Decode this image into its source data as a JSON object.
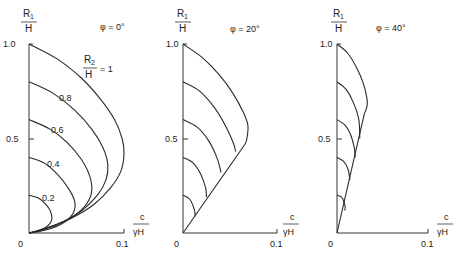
{
  "chart_data": [
    {
      "type": "line",
      "title": "φ = 0°",
      "xlabel": "c/γH",
      "ylabel": "R1/H",
      "xlim": [
        0,
        0.1
      ],
      "ylim": [
        0,
        1.0
      ],
      "xticks": [
        "0",
        "0.1"
      ],
      "yticks": [
        "0.5",
        "1.0"
      ],
      "grid": false,
      "legend_label": "R2/H = 1",
      "series": [
        {
          "name": "R2/H = 1",
          "label": "R2/H = 1",
          "points": [
            [
              0,
              1.0
            ],
            [
              0.03,
              0.92
            ],
            [
              0.055,
              0.82
            ],
            [
              0.075,
              0.71
            ],
            [
              0.09,
              0.6
            ],
            [
              0.098,
              0.5
            ],
            [
              0.1,
              0.42
            ],
            [
              0.097,
              0.33
            ],
            [
              0.086,
              0.24
            ],
            [
              0.068,
              0.15
            ],
            [
              0.045,
              0.08
            ],
            [
              0.02,
              0.03
            ],
            [
              0,
              0
            ]
          ]
        },
        {
          "name": "R2/H = 0.8",
          "label": "0.8",
          "points": [
            [
              0,
              0.8
            ],
            [
              0.025,
              0.74
            ],
            [
              0.048,
              0.65
            ],
            [
              0.066,
              0.55
            ],
            [
              0.078,
              0.45
            ],
            [
              0.083,
              0.36
            ],
            [
              0.081,
              0.28
            ],
            [
              0.072,
              0.2
            ],
            [
              0.056,
              0.12
            ],
            [
              0.036,
              0.06
            ],
            [
              0.016,
              0.02
            ],
            [
              0,
              0
            ]
          ]
        },
        {
          "name": "R2/H = 0.6",
          "label": "0.6",
          "points": [
            [
              0,
              0.6
            ],
            [
              0.022,
              0.55
            ],
            [
              0.04,
              0.48
            ],
            [
              0.055,
              0.39
            ],
            [
              0.064,
              0.3
            ],
            [
              0.066,
              0.22
            ],
            [
              0.06,
              0.15
            ],
            [
              0.047,
              0.09
            ],
            [
              0.03,
              0.045
            ],
            [
              0.013,
              0.015
            ],
            [
              0,
              0
            ]
          ]
        },
        {
          "name": "R2/H = 0.4",
          "label": "0.4",
          "points": [
            [
              0,
              0.4
            ],
            [
              0.016,
              0.37
            ],
            [
              0.03,
              0.31
            ],
            [
              0.041,
              0.24
            ],
            [
              0.048,
              0.17
            ],
            [
              0.047,
              0.11
            ],
            [
              0.038,
              0.06
            ],
            [
              0.024,
              0.025
            ],
            [
              0.01,
              0.007
            ],
            [
              0,
              0
            ]
          ]
        },
        {
          "name": "R2/H = 0.2",
          "label": "0.2",
          "points": [
            [
              0,
              0.2
            ],
            [
              0.01,
              0.185
            ],
            [
              0.018,
              0.15
            ],
            [
              0.023,
              0.11
            ],
            [
              0.024,
              0.07
            ],
            [
              0.019,
              0.035
            ],
            [
              0.01,
              0.012
            ],
            [
              0,
              0
            ]
          ]
        }
      ]
    },
    {
      "type": "line",
      "title": "φ = 20°",
      "xlabel": "c/γH",
      "ylabel": "R1/H",
      "xlim": [
        0,
        0.1
      ],
      "ylim": [
        0,
        1.0
      ],
      "xticks": [
        "0",
        "0.1"
      ],
      "yticks": [
        "0.5",
        "1.0"
      ],
      "grid": false,
      "series": [
        {
          "name": "R2/H = 1",
          "points": [
            [
              0,
              1.0
            ],
            [
              0.02,
              0.93
            ],
            [
              0.038,
              0.84
            ],
            [
              0.053,
              0.74
            ],
            [
              0.064,
              0.64
            ],
            [
              0.069,
              0.57
            ],
            [
              0.068,
              0.5
            ],
            [
              0.066,
              0.47
            ]
          ]
        },
        {
          "name": "R2/H = 0.8",
          "points": [
            [
              0,
              0.8
            ],
            [
              0.018,
              0.75
            ],
            [
              0.034,
              0.66
            ],
            [
              0.046,
              0.56
            ],
            [
              0.054,
              0.47
            ],
            [
              0.056,
              0.43
            ]
          ]
        },
        {
          "name": "R2/H = 0.6",
          "points": [
            [
              0,
              0.6
            ],
            [
              0.015,
              0.56
            ],
            [
              0.027,
              0.49
            ],
            [
              0.036,
              0.4
            ],
            [
              0.04,
              0.33
            ],
            [
              0.04,
              0.32
            ]
          ]
        },
        {
          "name": "R2/H = 0.4",
          "points": [
            [
              0,
              0.4
            ],
            [
              0.011,
              0.37
            ],
            [
              0.019,
              0.31
            ],
            [
              0.024,
              0.24
            ],
            [
              0.025,
              0.19
            ]
          ]
        },
        {
          "name": "R2/H = 0.2",
          "points": [
            [
              0,
              0.2
            ],
            [
              0.007,
              0.18
            ],
            [
              0.011,
              0.14
            ],
            [
              0.013,
              0.1
            ],
            [
              0.012,
              0.085
            ]
          ]
        },
        {
          "name": "envelope",
          "points": [
            [
              0,
              0
            ],
            [
              0.066,
              0.47
            ]
          ]
        }
      ]
    },
    {
      "type": "line",
      "title": "φ = 40°",
      "xlabel": "c/γH",
      "ylabel": "R1/H",
      "xlim": [
        0,
        0.1
      ],
      "ylim": [
        0,
        1.0
      ],
      "xticks": [
        "0",
        "0.1"
      ],
      "yticks": [
        "0.5",
        "1.0"
      ],
      "grid": false,
      "series": [
        {
          "name": "R2/H = 1",
          "points": [
            [
              0,
              1.0
            ],
            [
              0.012,
              0.95
            ],
            [
              0.022,
              0.87
            ],
            [
              0.029,
              0.79
            ],
            [
              0.033,
              0.71
            ],
            [
              0.033,
              0.67
            ],
            [
              0.03,
              0.63
            ]
          ]
        },
        {
          "name": "R2/H = 0.8",
          "points": [
            [
              0,
              0.8
            ],
            [
              0.01,
              0.76
            ],
            [
              0.018,
              0.69
            ],
            [
              0.024,
              0.6
            ],
            [
              0.025,
              0.5
            ]
          ]
        },
        {
          "name": "R2/H = 0.6",
          "points": [
            [
              0,
              0.6
            ],
            [
              0.009,
              0.57
            ],
            [
              0.015,
              0.52
            ],
            [
              0.019,
              0.45
            ],
            [
              0.02,
              0.4
            ]
          ]
        },
        {
          "name": "R2/H = 0.4",
          "points": [
            [
              0,
              0.4
            ],
            [
              0.007,
              0.38
            ],
            [
              0.012,
              0.34
            ],
            [
              0.014,
              0.29
            ],
            [
              0.014,
              0.28
            ]
          ]
        },
        {
          "name": "R2/H = 0.2",
          "points": [
            [
              0,
              0.2
            ],
            [
              0.005,
              0.19
            ],
            [
              0.008,
              0.16
            ],
            [
              0.009,
              0.13
            ],
            [
              0.008,
              0.12
            ]
          ]
        },
        {
          "name": "envelope",
          "points": [
            [
              0,
              0
            ],
            [
              0.03,
              0.63
            ]
          ]
        }
      ]
    }
  ],
  "panels": [
    {
      "phi_label": "φ = 0°",
      "ylabel_num": "R1",
      "ylabel_sub": "1",
      "ylabel_den": "H",
      "ytick_top": "1.0",
      "ytick_mid": "0.5",
      "x_origin": "0",
      "xtick_end": "0.1",
      "xlabel_num": "c",
      "xlabel_den": "γH",
      "legend": {
        "num": "R",
        "sub": "2",
        "den": "H",
        "eq": "= 1"
      },
      "curve_labels": [
        "0.8",
        "0.6",
        "0.4",
        "0.2"
      ]
    },
    {
      "phi_label": "φ = 20°",
      "ylabel_num": "R1",
      "ylabel_sub": "1",
      "ylabel_den": "H",
      "ytick_top": "1.0",
      "ytick_mid": "0.5",
      "x_origin": "0",
      "xtick_end": "0.1",
      "xlabel_num": "c",
      "xlabel_den": "γH"
    },
    {
      "phi_label": "φ = 40°",
      "ylabel_num": "R1",
      "ylabel_sub": "1",
      "ylabel_den": "H",
      "ytick_top": "1.0",
      "ytick_mid": "0.5",
      "x_origin": "0",
      "xtick_end": "0.1",
      "xlabel_num": "c",
      "xlabel_den": "γH"
    }
  ],
  "colors": {
    "line": "#2a2a2a",
    "text": "#222222",
    "background": "#ffffff"
  }
}
